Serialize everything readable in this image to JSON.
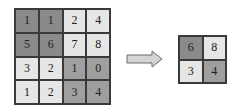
{
  "diagram": {
    "type": "max-pooling",
    "input_grid": {
      "rows": [
        [
          {
            "v": "1",
            "shade": "dark"
          },
          {
            "v": "1",
            "shade": "dark"
          },
          {
            "v": "2",
            "shade": "light"
          },
          {
            "v": "4",
            "shade": "light"
          }
        ],
        [
          {
            "v": "5",
            "shade": "dark"
          },
          {
            "v": "6",
            "shade": "dark"
          },
          {
            "v": "7",
            "shade": "light"
          },
          {
            "v": "8",
            "shade": "light"
          }
        ],
        [
          {
            "v": "3",
            "shade": "light"
          },
          {
            "v": "2",
            "shade": "light"
          },
          {
            "v": "1",
            "shade": "mid"
          },
          {
            "v": "0",
            "shade": "mid"
          }
        ],
        [
          {
            "v": "1",
            "shade": "light"
          },
          {
            "v": "2",
            "shade": "light"
          },
          {
            "v": "3",
            "shade": "mid"
          },
          {
            "v": "4",
            "shade": "mid"
          }
        ]
      ]
    },
    "arrow": {
      "direction": "right"
    },
    "output_grid": {
      "rows": [
        [
          {
            "v": "6",
            "shade": "dark"
          },
          {
            "v": "8",
            "shade": "light"
          }
        ],
        [
          {
            "v": "3",
            "shade": "light"
          },
          {
            "v": "4",
            "shade": "mid"
          }
        ]
      ]
    }
  }
}
